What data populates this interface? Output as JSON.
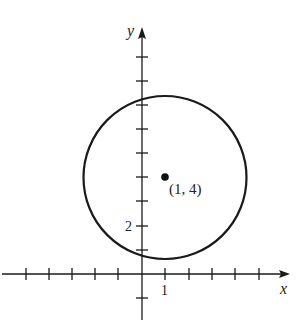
{
  "diagram": {
    "type": "coordinate-plane-circle",
    "axes": {
      "x_label": "x",
      "y_label": "y",
      "x_tick_label": "1",
      "y_tick_label": "2"
    },
    "circle": {
      "center": [
        1,
        4
      ],
      "center_label": "(1, 4)"
    },
    "colors": {
      "stroke": "#1a1a1a",
      "background": "#ffffff"
    }
  }
}
